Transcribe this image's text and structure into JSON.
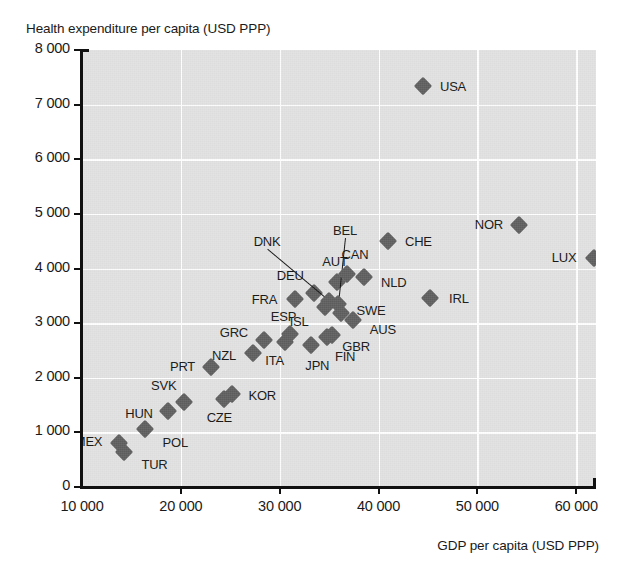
{
  "chart_data": {
    "type": "scatter",
    "title": "",
    "ylabel": "Health expenditure per capita (USD PPP)",
    "xlabel": "GDP per capita (USD PPP)",
    "xlim": [
      10000,
      62000
    ],
    "ylim": [
      0,
      8000
    ],
    "xticks": [
      "10 000",
      "20 000",
      "30 000",
      "40 000",
      "50 000",
      "60 000"
    ],
    "xtick_values": [
      10000,
      20000,
      30000,
      40000,
      50000,
      60000
    ],
    "yticks": [
      "0",
      "1 000",
      "2 000",
      "3 000",
      "4 000",
      "5 000",
      "6 000",
      "7 000",
      "8 000"
    ],
    "ytick_values": [
      0,
      1000,
      2000,
      3000,
      4000,
      5000,
      6000,
      7000,
      8000
    ],
    "grid": true,
    "legend": "none",
    "marker": "diamond",
    "marker_color": "#5e5e5e",
    "plot_background": "#e2e2e2",
    "gridline_color": "#ffffff",
    "points": [
      {
        "code": "MEX",
        "x": 13700,
        "y": 800,
        "lx": -30,
        "ly": -2
      },
      {
        "code": "TUR",
        "x": 14200,
        "y": 640,
        "lx": 31,
        "ly": 12
      },
      {
        "code": "POL",
        "x": 16400,
        "y": 1070,
        "lx": 30,
        "ly": 13
      },
      {
        "code": "HUN",
        "x": 18700,
        "y": 1400,
        "lx": -29,
        "ly": 2
      },
      {
        "code": "SVK",
        "x": 20300,
        "y": 1560,
        "lx": -20,
        "ly": -17
      },
      {
        "code": "PRT",
        "x": 23000,
        "y": 2200,
        "lx": -28,
        "ly": -1
      },
      {
        "code": "CZE",
        "x": 24400,
        "y": 1620,
        "lx": -5,
        "ly": 18
      },
      {
        "code": "KOR",
        "x": 25200,
        "y": 1700,
        "lx": 30,
        "ly": 1
      },
      {
        "code": "NZL",
        "x": 27300,
        "y": 2460,
        "lx": -29,
        "ly": 2
      },
      {
        "code": "GRC",
        "x": 28400,
        "y": 2700,
        "lx": -30,
        "ly": -8
      },
      {
        "code": "ITA",
        "x": 30500,
        "y": 2650,
        "lx": -10,
        "ly": 18
      },
      {
        "code": "ESP",
        "x": 31000,
        "y": 2800,
        "lx": -6,
        "ly": -18
      },
      {
        "code": "FRA",
        "x": 31500,
        "y": 3450,
        "lx": -30,
        "ly": 0
      },
      {
        "code": "JPN",
        "x": 33200,
        "y": 2600,
        "lx": 6,
        "ly": 20
      },
      {
        "code": "DEU",
        "x": 33500,
        "y": 3550,
        "lx": -24,
        "ly": -18
      },
      {
        "code": "ISL",
        "x": 34600,
        "y": 3300,
        "lx": -26,
        "ly": 14
      },
      {
        "code": "FIN",
        "x": 34800,
        "y": 2750,
        "lx": 18,
        "ly": 19
      },
      {
        "code": "DNK",
        "x": 35000,
        "y": 3400,
        "lx": -62,
        "ly": -60,
        "leader": true
      },
      {
        "code": "GBR",
        "x": 35300,
        "y": 2780,
        "lx": 24,
        "ly": 11
      },
      {
        "code": "AUT",
        "x": 35800,
        "y": 3750,
        "lx": -2,
        "ly": -21
      },
      {
        "code": "BEL",
        "x": 35900,
        "y": 3350,
        "lx": 7,
        "ly": -74,
        "leader": true
      },
      {
        "code": "SWE",
        "x": 36200,
        "y": 3180,
        "lx": 30,
        "ly": -3
      },
      {
        "code": "CAN",
        "x": 36800,
        "y": 3900,
        "lx": 8,
        "ly": -20
      },
      {
        "code": "AUS",
        "x": 37400,
        "y": 3050,
        "lx": 30,
        "ly": 9
      },
      {
        "code": "NLD",
        "x": 38500,
        "y": 3840,
        "lx": 30,
        "ly": 5
      },
      {
        "code": "CHE",
        "x": 41000,
        "y": 4500,
        "lx": 30,
        "ly": 0
      },
      {
        "code": "USA",
        "x": 44500,
        "y": 7350,
        "lx": 30,
        "ly": 0
      },
      {
        "code": "IRL",
        "x": 45200,
        "y": 3460,
        "lx": 29,
        "ly": 0
      },
      {
        "code": "NOR",
        "x": 54200,
        "y": 4800,
        "lx": -30,
        "ly": -1
      },
      {
        "code": "LUX",
        "x": 61800,
        "y": 4200,
        "lx": -30,
        "ly": -1
      }
    ]
  }
}
